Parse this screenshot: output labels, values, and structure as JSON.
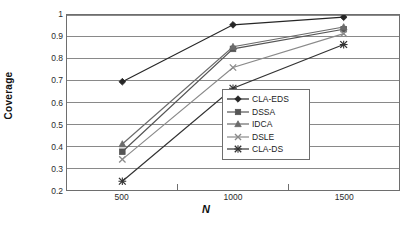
{
  "chart_data": {
    "type": "line",
    "title": "",
    "xlabel": "N",
    "ylabel": "Coverage",
    "categories": [
      "500",
      "1000",
      "1500"
    ],
    "x": [
      500,
      1000,
      1500
    ],
    "ylim": [
      0.2,
      1.0
    ],
    "ytick_step": 0.1,
    "yticks": [
      "1",
      "0.9",
      "0.8",
      "0.7",
      "0.6",
      "0.5",
      "0.4",
      "0.3",
      "0.2"
    ],
    "ytick_values": [
      1,
      0.9,
      0.8,
      0.7,
      0.6,
      0.5,
      0.4,
      0.3,
      0.2
    ],
    "grid": "horizontal",
    "legend_position": "inside-bottom-right",
    "series": [
      {
        "name": "CLA-EDS",
        "marker": "diamond",
        "color": "#262626",
        "values": [
          0.695,
          0.955,
          0.99
        ]
      },
      {
        "name": "DSSA",
        "marker": "square",
        "color": "#555555",
        "values": [
          0.375,
          0.845,
          0.935
        ]
      },
      {
        "name": "IDCA",
        "marker": "triangle",
        "color": "#6b6b6b",
        "values": [
          0.41,
          0.855,
          0.945
        ]
      },
      {
        "name": "DSLE",
        "marker": "cross-x",
        "color": "#8a8a8a",
        "values": [
          0.34,
          0.76,
          0.915
        ]
      },
      {
        "name": "CLA-DS",
        "marker": "star-x",
        "color": "#333333",
        "values": [
          0.24,
          0.665,
          0.865
        ]
      }
    ]
  },
  "axes": {
    "y_title": "Coverage",
    "x_title": "N"
  },
  "legend": {
    "entries": [
      {
        "label": "CLA-EDS"
      },
      {
        "label": "DSSA"
      },
      {
        "label": "IDCA"
      },
      {
        "label": "DSLE"
      },
      {
        "label": "CLA-DS"
      }
    ]
  },
  "colors": {
    "frame": "#6e6e6e",
    "grid": "#888888",
    "background": "#ffffff",
    "text": "#1a1a1a"
  }
}
